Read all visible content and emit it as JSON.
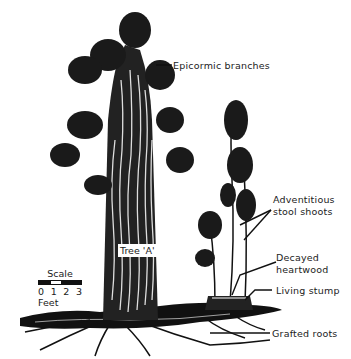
{
  "labels": {
    "epicormic": "Epicormic branches",
    "adventitious_line1": "Adventitious",
    "adventitious_line2": "stool shoots",
    "decayed_line1": "Decayed",
    "decayed_line2": "heartwood",
    "living_stump": "Living stump",
    "grafted_roots": "Grafted roots",
    "tree_a": "Tree 'A'"
  },
  "scale": {
    "title": "Scale",
    "ticks": [
      "0",
      "1",
      "2",
      "3"
    ],
    "unit": "Feet"
  }
}
